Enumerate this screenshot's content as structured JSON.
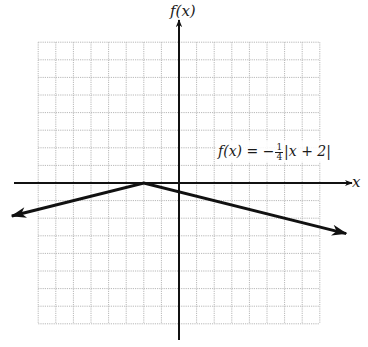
{
  "chart_data": {
    "type": "line",
    "title": "",
    "xlabel": "x",
    "ylabel": "f(x)",
    "function": "f(x) = -1/4|x + 2|",
    "annotation": {
      "text_prefix": "f(x) = −",
      "fraction_numerator": "1",
      "fraction_denominator": "4",
      "text_suffix": "|x + 2|"
    },
    "grid": true,
    "xlim": [
      -8,
      8
    ],
    "ylim": [
      -8,
      8
    ],
    "vertex": [
      -2,
      0
    ],
    "x": [
      -9.5,
      -2,
      9.5
    ],
    "y": [
      -1.875,
      0,
      -2.875
    ],
    "series": [
      {
        "name": "f(x) = -1/4|x + 2|",
        "x": [
          -9.5,
          -2,
          9.5
        ],
        "y": [
          -1.875,
          0,
          -2.875
        ]
      }
    ],
    "colors": {
      "grid": "#b8b8b8",
      "axis": "#111111",
      "curve": "#111111"
    }
  }
}
